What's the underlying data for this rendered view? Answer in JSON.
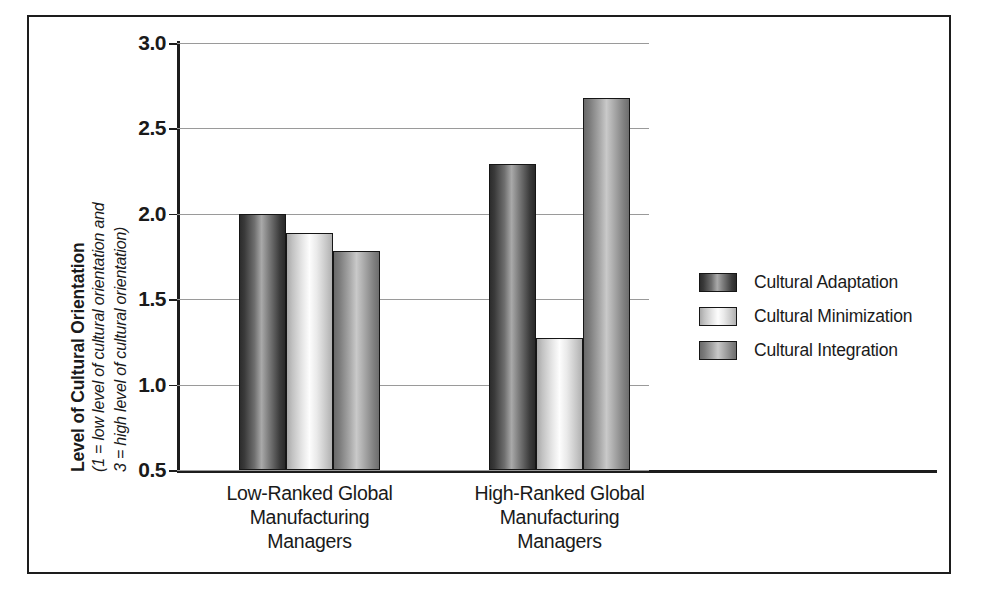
{
  "figure": {
    "y_axis_title_main": "Level of Cultural Orientation",
    "y_axis_title_sub1": "(1 = low level of cultural orientation and",
    "y_axis_title_sub2": "3 = high level of cultural orientation)"
  },
  "legend": {
    "position": "right",
    "items": [
      {
        "label": "Cultural Adaptation",
        "key": "adaptation",
        "color": "#3a3a3a"
      },
      {
        "label": "Cultural Minimization",
        "key": "minimization",
        "color": "#eaeaea"
      },
      {
        "label": "Cultural Integration",
        "key": "integration",
        "color": "#9a9a9a"
      }
    ]
  },
  "chart_data": {
    "type": "bar",
    "title": "",
    "xlabel": "",
    "ylabel": "Level of Cultural Orientation (1 = low level of cultural orientation and 3 = high level of cultural orientation)",
    "ylim": [
      0.5,
      3.0
    ],
    "yticks": [
      "3.0",
      "2.5",
      "2.0",
      "1.5",
      "1.0",
      "0.5"
    ],
    "ytick_values": [
      3.0,
      2.5,
      2.0,
      1.5,
      1.0,
      0.5
    ],
    "grid": true,
    "legend_position": "right",
    "categories": [
      "Low-Ranked Global\nManufacturing\nManagers",
      "High-Ranked Global\nManufacturing\nManagers"
    ],
    "series": [
      {
        "name": "Cultural Adaptation",
        "values": [
          2.0,
          2.29
        ]
      },
      {
        "name": "Cultural Minimization",
        "values": [
          1.89,
          1.27
        ]
      },
      {
        "name": "Cultural Integration",
        "values": [
          1.78,
          2.68
        ]
      }
    ]
  }
}
